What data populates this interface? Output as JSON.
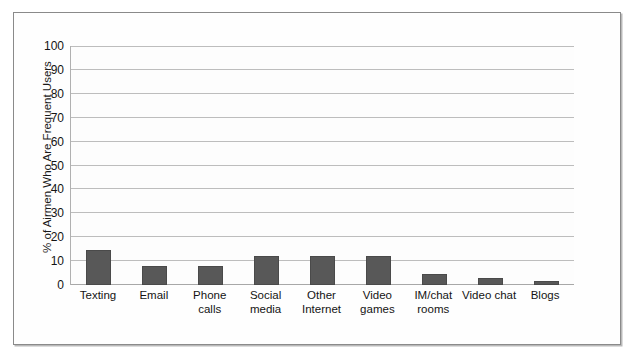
{
  "chart_data": {
    "type": "bar",
    "title": "",
    "subtitle": "",
    "xlabel": "",
    "ylabel": "% of Airmen Who Are Frequent Users",
    "ylim": [
      0,
      100
    ],
    "ytick_step": 10,
    "yticks": [
      "100",
      "90",
      "80",
      "70",
      "60",
      "50",
      "40",
      "30",
      "20",
      "10",
      "0"
    ],
    "grid": true,
    "legend": "none",
    "bar_color": "#585858",
    "categories": [
      "Texting",
      "Email",
      "Phone calls",
      "Social media",
      "Other Internet",
      "Video games",
      "IM/chat rooms",
      "Video chat",
      "Blogs"
    ],
    "category_lines": [
      [
        "Texting"
      ],
      [
        "Email"
      ],
      [
        "Phone",
        "calls"
      ],
      [
        "Social",
        "media"
      ],
      [
        "Other",
        "Internet"
      ],
      [
        "Video",
        "games"
      ],
      [
        "IM/chat",
        "rooms"
      ],
      [
        "Video chat"
      ],
      [
        "Blogs"
      ]
    ],
    "values": [
      14.5,
      8,
      8,
      12,
      12,
      12,
      4.5,
      3,
      1.5
    ]
  },
  "figure": {
    "frame_color": "#8a8a8a",
    "background": "#fefefe",
    "gridline_color": "#bdbdbd"
  }
}
